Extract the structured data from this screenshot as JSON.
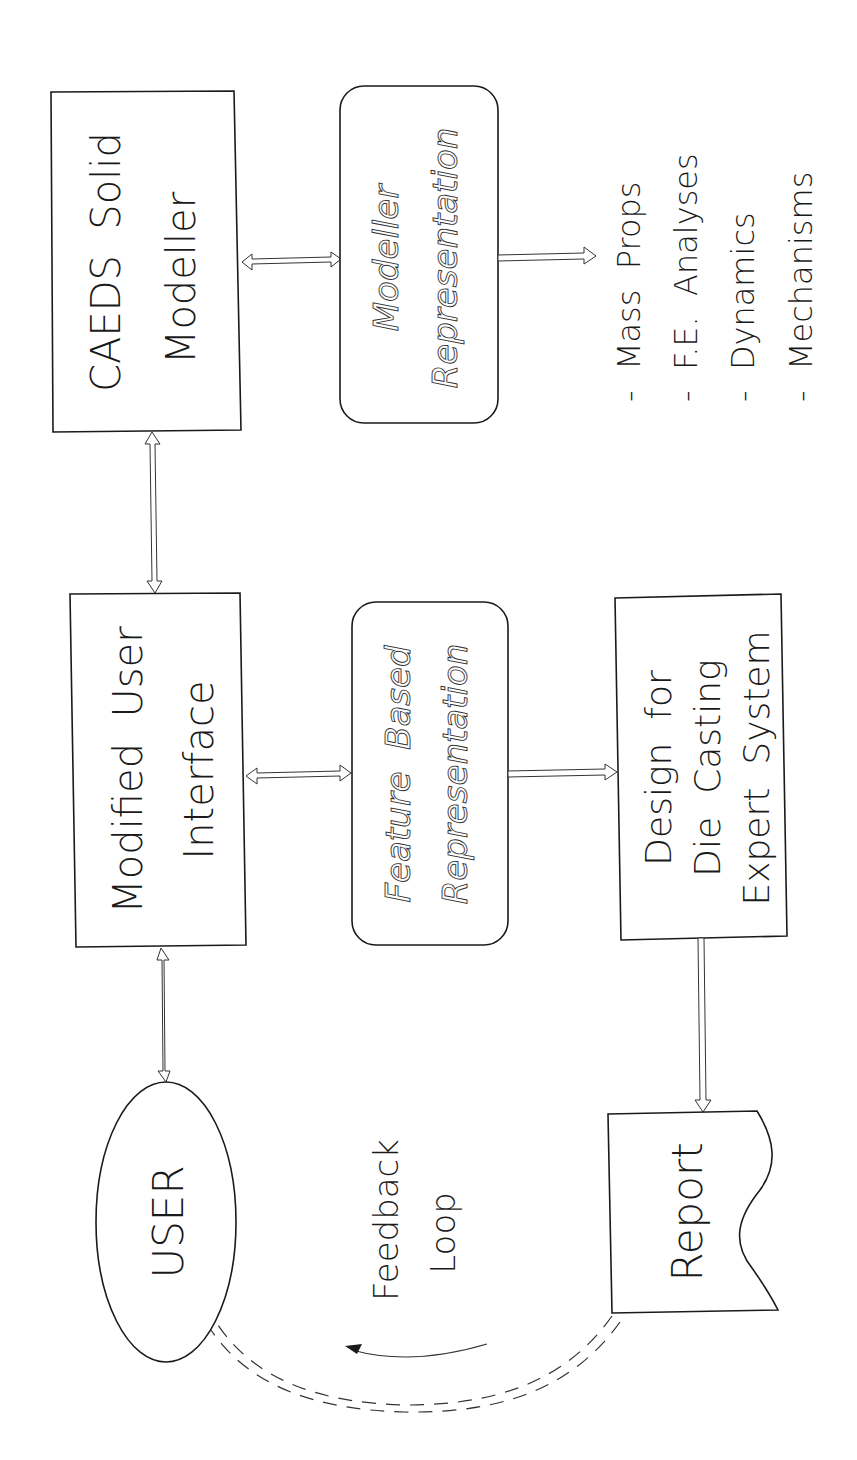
{
  "diagram": {
    "orientation": "rotated-90-ccw",
    "nodes": {
      "caeds": {
        "line1": "CAEDS  Solid",
        "line2": "Modeller"
      },
      "modeller_rep": {
        "line1": "Modeller",
        "line2": "Representation"
      },
      "outputs": {
        "items": [
          "-  Mass  Props",
          "-  F.E.  Analyses",
          "-  Dynamics",
          "-  Mechanisms"
        ]
      },
      "mui": {
        "line1": "Modified  User",
        "line2": "Interface"
      },
      "feature_rep": {
        "line1": "Feature  Based",
        "line2": "Representation"
      },
      "dfdc": {
        "line1": "Design  for",
        "line2": "Die  Casting",
        "line3": "Expert  System"
      },
      "user": {
        "label": "USER"
      },
      "report": {
        "label": "Report"
      },
      "feedback": {
        "line1": "Feedback",
        "line2": "Loop"
      }
    },
    "edges": [
      {
        "from": "caeds",
        "to": "modeller_rep",
        "type": "bidirectional"
      },
      {
        "from": "modeller_rep",
        "to": "outputs",
        "type": "directed"
      },
      {
        "from": "caeds",
        "to": "mui",
        "type": "bidirectional"
      },
      {
        "from": "mui",
        "to": "feature_rep",
        "type": "bidirectional"
      },
      {
        "from": "feature_rep",
        "to": "dfdc",
        "type": "directed"
      },
      {
        "from": "mui",
        "to": "user",
        "type": "bidirectional"
      },
      {
        "from": "dfdc",
        "to": "report",
        "type": "directed"
      },
      {
        "from": "report",
        "to": "user",
        "type": "dashed-feedback"
      }
    ],
    "colors": {
      "stroke": "#1a1a1a",
      "background": "#ffffff"
    }
  }
}
